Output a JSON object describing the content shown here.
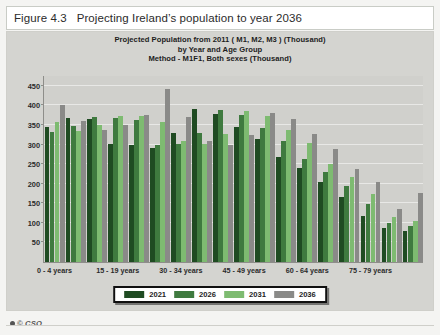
{
  "figure": {
    "caption_number": "Figure 4.3",
    "caption_text": "Projecting Ireland’s population to year 2036"
  },
  "footer": {
    "copyright": "© CSO",
    "mark_icon": "copyright-icon"
  },
  "chart_data": {
    "type": "bar",
    "title": "Projected Population from 2011 ( M1, M2, M3 ) (Thousand)",
    "subtitle": "by Year and Age Group",
    "subtitle2": "Method - M1F1, Both sexes (Thousand)",
    "xlabel": "",
    "ylabel": "",
    "ylim": [
      0,
      475
    ],
    "yticks": [
      50,
      100,
      150,
      200,
      250,
      300,
      350,
      400,
      450
    ],
    "grid": true,
    "legend_position": "bottom",
    "categories": [
      "0 - 4 years",
      "5 - 9 years",
      "10 - 14 years",
      "15 - 19 years",
      "20 - 24 years",
      "25 - 29 years",
      "30 - 34 years",
      "35 - 39 years",
      "40 - 44 years",
      "45 - 49 years",
      "50 - 54 years",
      "55 - 59 years",
      "60 - 64 years",
      "65 - 69 years",
      "70 - 74 years",
      "75 - 79 years",
      "80 - 84 years",
      "85 years and over"
    ],
    "visible_tick_labels": [
      "0 - 4 years",
      "15 - 19 years",
      "30 - 34 years",
      "45 - 49 years",
      "60 - 64 years",
      "75 - 79 years"
    ],
    "visible_tick_indices": [
      0,
      3,
      6,
      9,
      12,
      15
    ],
    "series": [
      {
        "name": "2021",
        "color": "#1f4b22",
        "values": [
          345,
          368,
          366,
          302,
          300,
          290,
          330,
          390,
          378,
          345,
          315,
          268,
          240,
          205,
          165,
          118,
          88,
          78
        ]
      },
      {
        "name": "2026",
        "color": "#3f7a3f",
        "values": [
          332,
          347,
          370,
          368,
          362,
          298,
          302,
          330,
          388,
          376,
          342,
          310,
          262,
          230,
          193,
          148,
          100,
          93
        ]
      },
      {
        "name": "2031",
        "color": "#7ebb71",
        "values": [
          357,
          334,
          349,
          372,
          372,
          358,
          310,
          302,
          328,
          385,
          372,
          337,
          303,
          251,
          217,
          173,
          116,
          105
        ]
      },
      {
        "name": "2036",
        "color": "#8a8a88",
        "values": [
          400,
          359,
          336,
          351,
          375,
          442,
          370,
          310,
          300,
          325,
          380,
          365,
          327,
          288,
          237,
          204,
          136,
          176
        ]
      }
    ]
  },
  "legend": {
    "items": [
      {
        "label": "2021",
        "color": "#1f4b22",
        "swatch_icon": "color-swatch-icon"
      },
      {
        "label": "2026",
        "color": "#3f7a3f",
        "swatch_icon": "color-swatch-icon"
      },
      {
        "label": "2031",
        "color": "#7ebb71",
        "swatch_icon": "color-swatch-icon"
      },
      {
        "label": "2036",
        "color": "#8a8a88",
        "swatch_icon": "color-swatch-icon"
      }
    ]
  }
}
